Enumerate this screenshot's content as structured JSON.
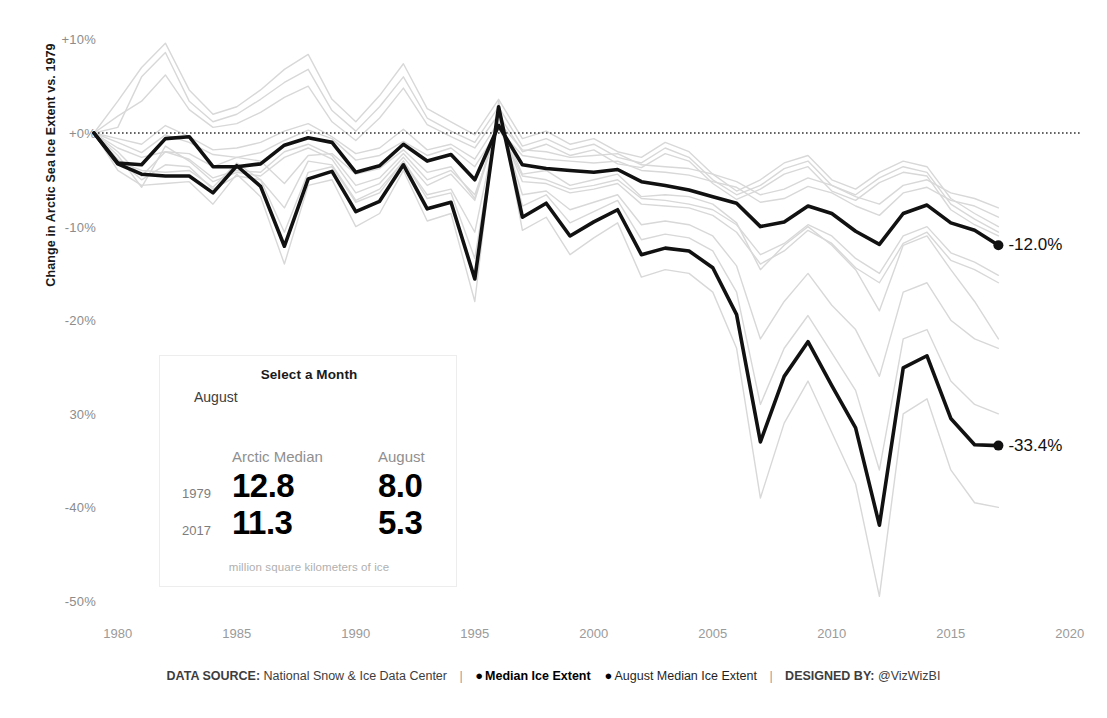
{
  "chart_data": {
    "type": "line",
    "title": "",
    "xlabel": "",
    "ylabel": "Change in Arctic Sea Ice Extent vs. 1979",
    "xlim": [
      1979,
      2021
    ],
    "ylim": [
      -50,
      10
    ],
    "xticks": [
      "1980",
      "1985",
      "1990",
      "1995",
      "2000",
      "2005",
      "2010",
      "2015",
      "2020"
    ],
    "xtick_values": [
      1980,
      1985,
      1990,
      1995,
      2000,
      2005,
      2010,
      2015,
      2020
    ],
    "yticks": [
      "+10%",
      "+0%",
      "-10%",
      "-20%",
      "30%",
      "-40%",
      "-50%"
    ],
    "ytick_values": [
      10,
      0,
      -10,
      -20,
      -30,
      -40,
      -50
    ],
    "grid": false,
    "reference_line": {
      "value": 0,
      "style": "dotted",
      "color": "#333333"
    },
    "legend_position": "bottom",
    "x": [
      1979,
      1980,
      1981,
      1982,
      1983,
      1984,
      1985,
      1986,
      1987,
      1988,
      1989,
      1990,
      1991,
      1992,
      1993,
      1994,
      1995,
      1996,
      1997,
      1998,
      1999,
      2000,
      2001,
      2002,
      2003,
      2004,
      2005,
      2006,
      2007,
      2008,
      2009,
      2010,
      2011,
      2012,
      2013,
      2014,
      2015,
      2016,
      2017
    ],
    "series": [
      {
        "name": "Median Ice Extent",
        "color": "#111111",
        "emphasis": "bold",
        "end_label": "-12.0%",
        "values": [
          0.0,
          -3.2,
          -3.4,
          -0.6,
          -0.4,
          -3.6,
          -3.6,
          -3.3,
          -1.3,
          -0.5,
          -1.0,
          -4.2,
          -3.5,
          -1.2,
          -3.0,
          -2.3,
          -5.0,
          0.8,
          -3.4,
          -3.8,
          -4.0,
          -4.2,
          -3.9,
          -5.2,
          -5.6,
          -6.1,
          -6.8,
          -7.5,
          -10.0,
          -9.5,
          -7.8,
          -8.6,
          -10.5,
          -11.9,
          -8.6,
          -7.7,
          -9.6,
          -10.4,
          -12.0
        ]
      },
      {
        "name": "August Median Ice Extent",
        "color": "#111111",
        "emphasis": "bold",
        "end_label": "-33.4%",
        "values": [
          0.0,
          -3.3,
          -4.4,
          -4.6,
          -4.6,
          -6.4,
          -3.5,
          -5.7,
          -12.1,
          -4.9,
          -4.1,
          -8.4,
          -7.3,
          -3.4,
          -8.1,
          -7.4,
          -15.6,
          2.8,
          -9.0,
          -7.5,
          -11.0,
          -9.5,
          -8.2,
          -13.0,
          -12.3,
          -12.6,
          -14.4,
          -19.4,
          -33.0,
          -26.0,
          -22.3,
          -27.0,
          -31.5,
          -41.9,
          -25.1,
          -23.8,
          -30.5,
          -33.3,
          -33.4
        ]
      },
      {
        "name": "January",
        "color": "#d8d8d8",
        "emphasis": "faint",
        "values": [
          0.0,
          -1.0,
          -2.1,
          -0.2,
          -1.0,
          -2.3,
          -2.6,
          -2.1,
          -0.8,
          0.3,
          -0.6,
          -2.9,
          -2.4,
          -0.9,
          -2.4,
          -1.6,
          -3.6,
          0.4,
          -2.4,
          -2.8,
          -3.0,
          -3.2,
          -3.0,
          -4.0,
          -4.2,
          -4.5,
          -5.2,
          -5.8,
          -7.4,
          -7.0,
          -5.7,
          -6.4,
          -7.8,
          -8.8,
          -6.4,
          -5.8,
          -7.2,
          -7.8,
          -9.0
        ]
      },
      {
        "name": "February",
        "color": "#d8d8d8",
        "emphasis": "faint",
        "values": [
          0.0,
          1.8,
          3.4,
          6.2,
          2.5,
          0.6,
          1.0,
          2.2,
          3.8,
          5.0,
          1.2,
          -0.8,
          1.6,
          4.8,
          0.9,
          -0.4,
          -1.6,
          2.0,
          -2.0,
          -1.2,
          -2.4,
          -1.8,
          -3.3,
          -3.7,
          -2.2,
          -3.0,
          -5.4,
          -7.1,
          -6.0,
          -4.4,
          -3.6,
          -6.2,
          -7.2,
          -5.3,
          -4.2,
          -4.6,
          -8.2,
          -9.8,
          -11.0
        ]
      },
      {
        "name": "March",
        "color": "#d8d8d8",
        "emphasis": "faint",
        "values": [
          0.0,
          3.4,
          7.0,
          9.6,
          4.6,
          2.0,
          2.8,
          4.6,
          6.8,
          8.4,
          3.6,
          1.2,
          4.0,
          7.4,
          2.6,
          1.2,
          -0.2,
          3.6,
          -0.6,
          0.2,
          -1.2,
          -0.6,
          -2.0,
          -2.6,
          -1.0,
          -2.0,
          -4.4,
          -6.2,
          -5.0,
          -3.2,
          -2.4,
          -5.0,
          -6.0,
          -4.2,
          -3.0,
          -3.6,
          -7.0,
          -8.6,
          -10.0
        ]
      },
      {
        "name": "April",
        "color": "#d8d8d8",
        "emphasis": "faint",
        "values": [
          0.0,
          -2.4,
          -5.8,
          -1.4,
          -3.0,
          -5.2,
          -4.2,
          -4.6,
          -2.6,
          -1.6,
          -2.8,
          -6.4,
          -5.4,
          -2.6,
          -5.6,
          -4.4,
          -7.2,
          1.0,
          -5.2,
          -5.4,
          -6.4,
          -6.0,
          -5.4,
          -7.6,
          -7.8,
          -8.0,
          -8.8,
          -10.6,
          -14.0,
          -12.6,
          -10.4,
          -11.8,
          -14.4,
          -16.0,
          -11.8,
          -10.6,
          -13.6,
          -14.6,
          -16.0
        ]
      },
      {
        "name": "May",
        "color": "#d8d8d8",
        "emphasis": "faint",
        "values": [
          0.0,
          -0.6,
          -1.2,
          0.8,
          -0.4,
          -1.8,
          -1.6,
          -1.0,
          0.2,
          1.0,
          -0.4,
          -2.2,
          -1.6,
          0.4,
          -1.8,
          -1.2,
          -2.8,
          1.2,
          -1.8,
          -2.0,
          -2.6,
          -2.4,
          -2.2,
          -3.4,
          -3.6,
          -3.8,
          -4.4,
          -5.2,
          -6.6,
          -6.0,
          -4.8,
          -5.6,
          -6.8,
          -7.6,
          -5.6,
          -5.0,
          -6.4,
          -7.0,
          -8.0
        ]
      },
      {
        "name": "June",
        "color": "#d8d8d8",
        "emphasis": "faint",
        "values": [
          0.0,
          -2.0,
          -4.6,
          -2.0,
          -2.8,
          -4.8,
          -4.0,
          -4.2,
          -2.0,
          -1.2,
          -2.4,
          -5.6,
          -4.8,
          -2.2,
          -5.0,
          -4.0,
          -6.6,
          0.6,
          -4.6,
          -5.0,
          -6.0,
          -5.6,
          -5.0,
          -7.0,
          -7.2,
          -7.6,
          -8.2,
          -9.8,
          -13.0,
          -11.8,
          -9.8,
          -11.0,
          -13.4,
          -15.0,
          -11.0,
          -10.0,
          -12.8,
          -13.8,
          -15.2
        ]
      },
      {
        "name": "July",
        "color": "#d8d8d8",
        "emphasis": "faint",
        "values": [
          0.0,
          -2.8,
          -5.0,
          -3.4,
          -3.6,
          -6.0,
          -4.6,
          -5.0,
          -8.0,
          -3.0,
          -3.4,
          -7.2,
          -6.0,
          -3.0,
          -6.6,
          -6.0,
          -10.6,
          1.6,
          -6.6,
          -6.2,
          -8.2,
          -7.4,
          -6.6,
          -9.8,
          -9.4,
          -9.8,
          -11.0,
          -14.2,
          -22.0,
          -18.0,
          -15.0,
          -18.4,
          -21.0,
          -26.0,
          -17.0,
          -16.0,
          -20.0,
          -22.0,
          -23.0
        ]
      },
      {
        "name": "September",
        "color": "#d8d8d8",
        "emphasis": "faint",
        "values": [
          0.0,
          -4.0,
          -5.6,
          -5.4,
          -5.2,
          -7.6,
          -4.4,
          -6.8,
          -14.0,
          -5.6,
          -5.0,
          -10.0,
          -8.6,
          -4.0,
          -9.4,
          -8.6,
          -18.0,
          3.4,
          -10.4,
          -9.0,
          -13.0,
          -11.2,
          -9.6,
          -15.4,
          -14.6,
          -15.0,
          -17.0,
          -23.0,
          -39.0,
          -31.0,
          -26.5,
          -32.0,
          -37.5,
          -49.5,
          -30.0,
          -28.4,
          -36.0,
          -39.5,
          -40.0
        ]
      },
      {
        "name": "October",
        "color": "#d8d8d8",
        "emphasis": "faint",
        "values": [
          0.0,
          -3.0,
          -4.0,
          -4.2,
          -4.0,
          -5.8,
          -3.2,
          -5.0,
          -10.6,
          -4.2,
          -3.6,
          -7.4,
          -6.4,
          -3.0,
          -7.0,
          -6.4,
          -13.4,
          2.2,
          -7.8,
          -6.6,
          -9.6,
          -8.4,
          -7.2,
          -11.4,
          -10.8,
          -11.2,
          -12.6,
          -17.0,
          -29.0,
          -23.0,
          -19.5,
          -23.5,
          -27.5,
          -36.0,
          -22.0,
          -21.0,
          -26.5,
          -29.0,
          -30.0
        ]
      },
      {
        "name": "November",
        "color": "#d8d8d8",
        "emphasis": "faint",
        "values": [
          0.0,
          -1.6,
          -2.6,
          -2.0,
          -2.2,
          -3.6,
          -2.6,
          -3.0,
          -5.4,
          -2.4,
          -2.2,
          -4.4,
          -3.8,
          -1.8,
          -4.2,
          -3.6,
          -7.0,
          1.4,
          -4.4,
          -4.0,
          -5.6,
          -5.0,
          -4.4,
          -6.8,
          -6.6,
          -6.8,
          -7.6,
          -9.6,
          -14.6,
          -12.0,
          -10.0,
          -12.0,
          -14.6,
          -19.0,
          -12.0,
          -11.0,
          -14.6,
          -18.0,
          -22.0
        ]
      },
      {
        "name": "December",
        "color": "#d8d8d8",
        "emphasis": "faint",
        "values": [
          0.0,
          0.6,
          6.0,
          8.6,
          3.4,
          1.2,
          2.0,
          3.6,
          5.4,
          6.8,
          2.4,
          0.2,
          2.8,
          6.0,
          1.6,
          0.2,
          -1.0,
          2.8,
          -1.4,
          -0.6,
          -1.8,
          -1.2,
          -2.6,
          -3.2,
          -1.6,
          -2.6,
          -5.0,
          -6.6,
          -5.6,
          -3.8,
          -3.0,
          -5.6,
          -6.6,
          -4.8,
          -3.6,
          -4.2,
          -7.6,
          -9.2,
          -10.6
        ]
      }
    ]
  },
  "panel": {
    "title": "Select a Month",
    "selected_month": "August",
    "col_headers": [
      "Arctic Median",
      "August"
    ],
    "rows": [
      {
        "year": "1979",
        "arctic_median": "12.8",
        "month_value": "8.0"
      },
      {
        "year": "2017",
        "arctic_median": "11.3",
        "month_value": "5.3"
      }
    ],
    "footnote": "million square kilometers of ice"
  },
  "footer": {
    "data_source_label": "DATA SOURCE:",
    "data_source_value": "National Snow & Ice Data Center",
    "legend": [
      {
        "marker": "●",
        "label": "Median Ice Extent",
        "weight": "bold"
      },
      {
        "marker": "●",
        "label": "August Median Ice Extent",
        "weight": "regular"
      }
    ],
    "designed_by_label": "DESIGNED BY:",
    "designed_by_value": "@VizWizBI",
    "separator": "|"
  }
}
